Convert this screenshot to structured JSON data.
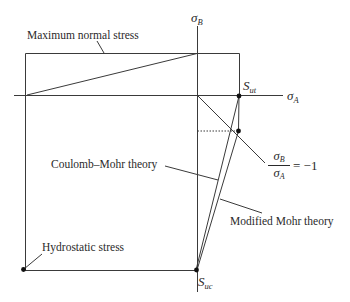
{
  "diagram": {
    "type": "failure-envelope",
    "axes": {
      "horizontal": {
        "symbol": "σ",
        "subscript": "A"
      },
      "vertical": {
        "symbol": "σ",
        "subscript": "B"
      }
    },
    "labels": {
      "max_normal_stress": "Maximum normal stress",
      "coulomb_mohr": "Coulomb–Mohr theory",
      "modified_mohr": "Modified Mohr theory",
      "hydrostatic": "Hydrostatic stress",
      "load_line": {
        "numerator": {
          "symbol": "σ",
          "subscript": "B"
        },
        "denominator": {
          "symbol": "σ",
          "subscript": "A"
        },
        "rhs": "= −1"
      }
    },
    "points": {
      "s_ut": {
        "symbol": "S",
        "subscript": "ut"
      },
      "s_uc": {
        "symbol": "S",
        "subscript": "uc"
      }
    },
    "colors": {
      "line": "#3a3a3a",
      "dot": "#111111",
      "text": "#2a2a2a",
      "background": "#ffffff"
    }
  }
}
